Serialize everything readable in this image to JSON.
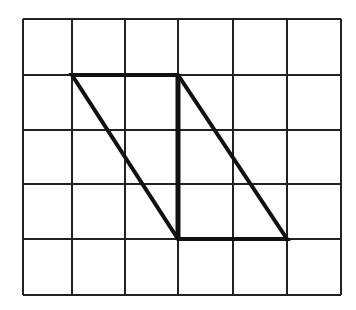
{
  "diagram": {
    "grid": {
      "columns": 6,
      "rows": 5,
      "x_lines": [
        23,
        72,
        125,
        178,
        233,
        287,
        341
      ],
      "y_lines": [
        19,
        75,
        130,
        184,
        239,
        295
      ],
      "line_color": "#222222"
    },
    "shape": {
      "type": "parallelogram",
      "vertices": [
        [
          72,
          75
        ],
        [
          178,
          75
        ],
        [
          287,
          239
        ],
        [
          178,
          239
        ]
      ],
      "divider": {
        "from": [
          178,
          75
        ],
        "to": [
          178,
          239
        ]
      },
      "stroke_color": "#111111"
    }
  }
}
